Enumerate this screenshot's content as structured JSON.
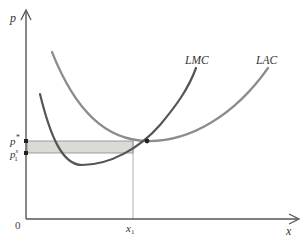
{
  "figure": {
    "caption": "",
    "axes": {
      "y_label": "p",
      "x_label": "x",
      "origin_label": "0"
    },
    "curves": [
      {
        "name": "LMC",
        "label": "LMC",
        "color": "#555555"
      },
      {
        "name": "LAC",
        "label": "LAC",
        "color": "#8c8c8c"
      }
    ],
    "y_ticks": [
      {
        "label": "p",
        "sup": "*",
        "sub": ""
      },
      {
        "label": "p",
        "sup": "s",
        "sub": "1"
      }
    ],
    "x_ticks": [
      {
        "label": "x",
        "sub": "1"
      }
    ],
    "shaded_region_color": "#d9dbd6",
    "colors": {
      "axis": "#555555",
      "guide": "#999999",
      "intersection": "#222222"
    }
  }
}
